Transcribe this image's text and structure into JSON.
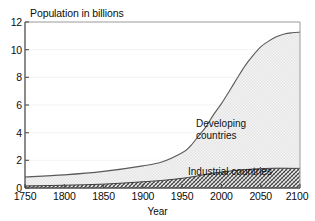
{
  "figure": {
    "cut_title": "World population projection",
    "axis_note_label": "Population in billions",
    "xlabel": "Year"
  },
  "annotations": {
    "developing_line1": "Developing",
    "developing_line2": "countries",
    "industrial": "Industrial countries"
  },
  "colors": {
    "axis": "#4d4d4d",
    "curve": "#555555",
    "developing_fill": "#efefef",
    "industrial_fill": "#b9b9b9",
    "gridline": "#f2f2f2",
    "text": "#111111"
  },
  "chart_data": {
    "type": "area",
    "title": "World population projection",
    "subtitle": "Population in billions",
    "xlabel": "Year",
    "ylabel": "Population in billions",
    "xlim": [
      1750,
      2100
    ],
    "ylim": [
      0,
      12
    ],
    "xticks": [
      1750,
      1800,
      1850,
      1900,
      1950,
      2000,
      2050,
      2100
    ],
    "yticks": [
      0,
      2,
      4,
      6,
      8,
      10,
      12
    ],
    "grid": true,
    "legend": "inline-annotations",
    "stacked": true,
    "x": [
      1750,
      1800,
      1850,
      1900,
      1925,
      1950,
      1960,
      1970,
      1980,
      1990,
      2000,
      2010,
      2020,
      2030,
      2040,
      2050,
      2060,
      2070,
      2080,
      2090,
      2100
    ],
    "series": [
      {
        "name": "Industrial countries",
        "values": [
          0.15,
          0.2,
          0.28,
          0.45,
          0.55,
          0.7,
          0.78,
          0.88,
          0.98,
          1.08,
          1.15,
          1.22,
          1.28,
          1.33,
          1.37,
          1.4,
          1.42,
          1.43,
          1.43,
          1.42,
          1.42
        ]
      },
      {
        "name": "Developing countries",
        "values": [
          0.65,
          0.75,
          0.92,
          1.15,
          1.35,
          1.85,
          2.22,
          2.82,
          3.42,
          4.22,
          4.95,
          5.78,
          6.65,
          7.5,
          8.2,
          8.8,
          9.2,
          9.5,
          9.7,
          9.8,
          9.85
        ]
      }
    ],
    "totals": [
      0.8,
      0.95,
      1.2,
      1.6,
      1.9,
      2.55,
      3.0,
      3.7,
      4.4,
      5.3,
      6.1,
      7.0,
      7.93,
      8.83,
      9.57,
      10.2,
      10.62,
      10.93,
      11.13,
      11.22,
      11.27
    ]
  }
}
